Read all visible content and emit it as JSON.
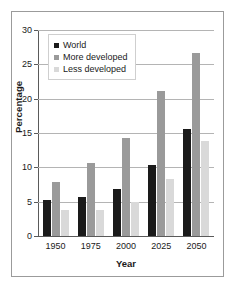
{
  "chart_data": {
    "type": "bar",
    "title": "",
    "subtitle": "",
    "xlabel": "Year",
    "ylabel": "Percentage",
    "categories": [
      "1950",
      "1975",
      "2000",
      "2025",
      "2050"
    ],
    "series": [
      {
        "name": "World",
        "color": "#1a1a1a",
        "values": [
          5.2,
          5.7,
          6.9,
          10.4,
          15.6
        ]
      },
      {
        "name": "More developed",
        "color": "#9a9a9a",
        "values": [
          7.9,
          10.6,
          14.3,
          21.1,
          26.6
        ]
      },
      {
        "name": "Less developed",
        "color": "#d9d9d9",
        "values": [
          3.8,
          3.8,
          5.0,
          8.3,
          13.9
        ]
      }
    ],
    "ylim": [
      0,
      30
    ],
    "yticks": [
      0,
      5,
      10,
      15,
      20,
      25,
      30
    ],
    "ytick_labels": [
      "0",
      "5",
      "10",
      "15",
      "20",
      "25",
      "30"
    ],
    "grid": true,
    "grid_axis": "y",
    "legend_position": "upper left",
    "bar_group_mode": "grouped",
    "annotations": []
  },
  "legend": {
    "items": [
      {
        "label": "World",
        "color": "#1a1a1a"
      },
      {
        "label": "More developed",
        "color": "#9a9a9a"
      },
      {
        "label": "Less developed",
        "color": "#d9d9d9"
      }
    ]
  },
  "colors": {
    "frame_border": "#9b9b9b",
    "gridline": "#b4b4b4",
    "axis": "#5a5a5a",
    "text": "#1a1a1a",
    "background": "#ffffff",
    "legend_border": "#cfcfcf"
  }
}
